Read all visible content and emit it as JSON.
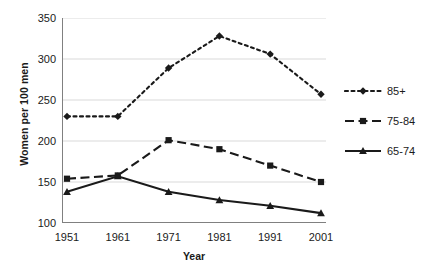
{
  "chart_data": {
    "type": "line",
    "title": "",
    "xlabel": "Year",
    "ylabel": "Women per 100 men",
    "categories": [
      "1951",
      "1961",
      "1971",
      "1981",
      "1991",
      "2001"
    ],
    "ylim": [
      100,
      350
    ],
    "yticks": [
      100,
      150,
      200,
      250,
      300,
      350
    ],
    "xlim_index": [
      0,
      5
    ],
    "grid": "horizontal",
    "legend_position": "right",
    "series": [
      {
        "name": "85+",
        "values": [
          230,
          230,
          289,
          328,
          306,
          257
        ],
        "color": "#1a1a1a",
        "linestyle": "dotted",
        "marker": "diamond"
      },
      {
        "name": "75-84",
        "values": [
          154,
          158,
          201,
          190,
          170,
          150
        ],
        "color": "#1a1a1a",
        "linestyle": "dashed",
        "marker": "square"
      },
      {
        "name": "65-74",
        "values": [
          138,
          157,
          138,
          128,
          121,
          112
        ],
        "color": "#1a1a1a",
        "linestyle": "solid",
        "marker": "triangle"
      }
    ]
  },
  "axes": {
    "y_tick_labels": [
      "350",
      "300",
      "250",
      "200",
      "150",
      "100"
    ],
    "x_tick_labels": [
      "1951",
      "1961",
      "1971",
      "1981",
      "1991",
      "2001"
    ],
    "y_title": "Women per 100 men",
    "x_title": "Year"
  },
  "legend": {
    "items": [
      {
        "label": "85+"
      },
      {
        "label": "75-84"
      },
      {
        "label": "65-74"
      }
    ]
  },
  "style": {
    "gridline_color": "#d9d9d9",
    "axis_color": "#808080",
    "series_color": "#1a1a1a",
    "background": "#ffffff"
  }
}
